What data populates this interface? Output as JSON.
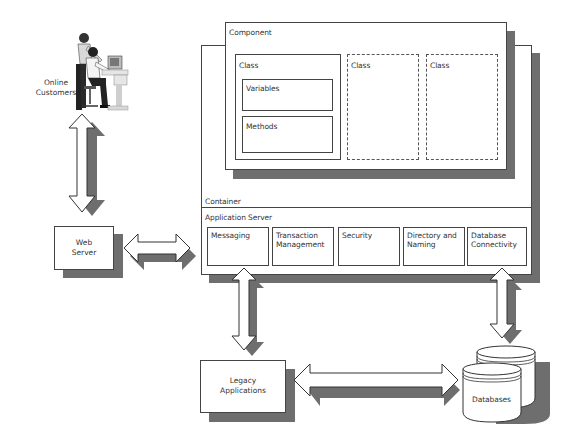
{
  "diagram": {
    "online_customers": {
      "label": "Online Customers",
      "icon": "people-at-computer-icon"
    },
    "web_server": {
      "label": "Web Server"
    },
    "component": {
      "label": "Component",
      "classes": [
        {
          "label": "Class",
          "style": "solid",
          "members": [
            "Variables",
            "Methods"
          ]
        },
        {
          "label": "Class",
          "style": "dashed"
        },
        {
          "label": "Class",
          "style": "dashed"
        }
      ]
    },
    "container": {
      "label": "Container"
    },
    "application_server": {
      "label": "Application Server",
      "services": [
        "Messaging",
        "Transaction Management",
        "Security",
        "Directory and Naming",
        "Database Connectivity"
      ]
    },
    "legacy_applications": {
      "label": "Legacy Applications"
    },
    "databases": {
      "label": "Databases",
      "icon": "database-cylinders-icon"
    },
    "connections": [
      {
        "from": "Online Customers",
        "to": "Web Server",
        "type": "bidirectional"
      },
      {
        "from": "Web Server",
        "to": "Application Server",
        "type": "bidirectional"
      },
      {
        "from": "Application Server (Messaging)",
        "to": "Legacy Applications",
        "type": "bidirectional"
      },
      {
        "from": "Application Server (Database Connectivity)",
        "to": "Databases",
        "type": "bidirectional"
      },
      {
        "from": "Legacy Applications",
        "to": "Databases",
        "type": "bidirectional"
      }
    ],
    "colors": {
      "shadow": "#6e6e6e",
      "border": "#444444",
      "background": "#ffffff"
    }
  }
}
